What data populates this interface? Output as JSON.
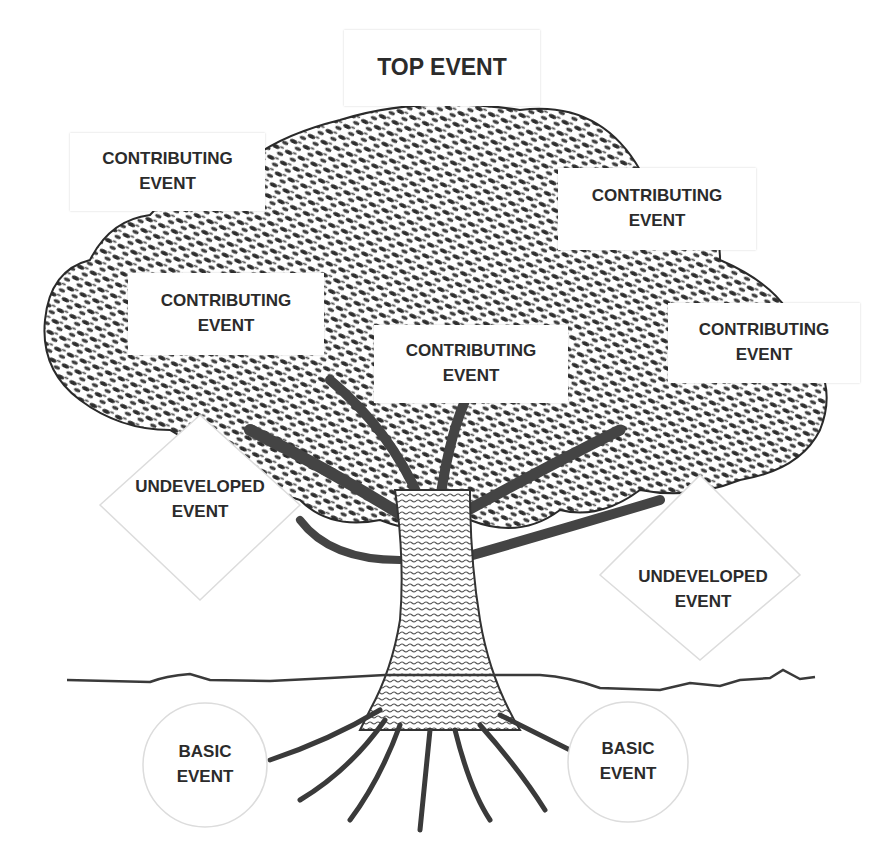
{
  "diagram": {
    "type": "fault-tree-analogy",
    "top_event": {
      "line1": "TOP EVENT"
    },
    "contributing_events": [
      {
        "line1": "CONTRIBUTING",
        "line2": "EVENT"
      },
      {
        "line1": "CONTRIBUTING",
        "line2": "EVENT"
      },
      {
        "line1": "CONTRIBUTING",
        "line2": "EVENT"
      },
      {
        "line1": "CONTRIBUTING",
        "line2": "EVENT"
      },
      {
        "line1": "CONTRIBUTING",
        "line2": "EVENT"
      }
    ],
    "undeveloped_events": [
      {
        "line1": "UNDEVELOPED",
        "line2": "EVENT"
      },
      {
        "line1": "UNDEVELOPED",
        "line2": "EVENT"
      }
    ],
    "basic_events": [
      {
        "line1": "BASIC",
        "line2": "EVENT"
      },
      {
        "line1": "BASIC",
        "line2": "EVENT"
      }
    ],
    "colors": {
      "ink": "#2b2b2b",
      "foliage": "#3a3a3a",
      "trunk": "#6a6a6a",
      "ground_line": "#3a3a3a",
      "shape_outline": "#d8d8d8"
    }
  }
}
